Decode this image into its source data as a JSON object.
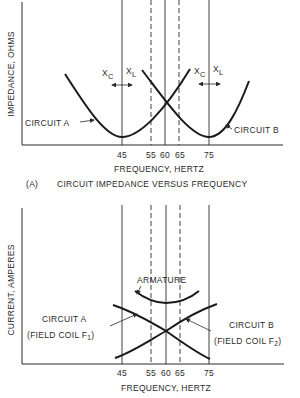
{
  "figure_a": {
    "y_label": "IMPEDANCE, OHMS",
    "x_label": "FREQUENCY, HERTZ",
    "caption_letter": "(A)",
    "caption": "CIRCUIT IMPEDANCE VERSUS FREQUENCY",
    "ticks": [
      "45",
      "55",
      "60",
      "65",
      "75"
    ],
    "solid_line_frequencies_hz": [
      45,
      60,
      75
    ],
    "dashed_line_frequencies_hz": [
      55,
      65
    ],
    "circuit_a_label": "CIRCUIT A",
    "circuit_b_label": "CIRCUIT B",
    "reactance_labels": {
      "xc": "X",
      "xc_sub": "C",
      "xl": "X",
      "xl_sub": "L"
    },
    "circuit_a_resonance_hz": 45,
    "circuit_b_resonance_hz": 75,
    "crossover_hz": 60
  },
  "figure_b": {
    "y_label": "CURRENT, AMPERES",
    "x_label": "FREQUENCY, HERTZ",
    "ticks": [
      "45",
      "55",
      "60",
      "65",
      "75"
    ],
    "armature_label": "ARMATURE",
    "circuit_a_label": "CIRCUIT A",
    "circuit_a_sub": "(FIELD COIL F",
    "circuit_a_sub_index": "1",
    "circuit_b_label": "CIRCUIT B",
    "circuit_b_sub": "(FIELD COIL F",
    "circuit_b_sub_index": "2",
    "crossover_hz": 60
  }
}
